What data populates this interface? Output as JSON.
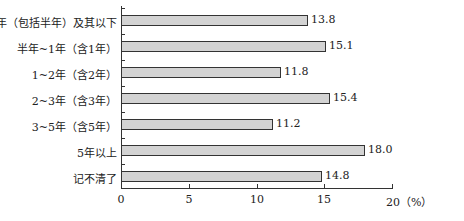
{
  "chart_data": {
    "type": "bar",
    "orientation": "horizontal",
    "title": "",
    "categories": [
      "半年（包括半年）及其以下",
      "半年~1年（含1年）",
      "1~2年（含2年）",
      "2~3年（含3年）",
      "3~5年（含5年）",
      "5年以上",
      "记不清了"
    ],
    "values": [
      13.8,
      15.1,
      11.8,
      15.4,
      11.2,
      18.0,
      14.8
    ],
    "value_labels": [
      "13.8",
      "15.1",
      "11.8",
      "15.4",
      "11.2",
      "18.0",
      "14.8"
    ],
    "xlabel": "（%）",
    "ylabel": "",
    "xlim": [
      0,
      20
    ],
    "xticks": [
      "0",
      "5",
      "10",
      "15",
      "20（%）"
    ],
    "grid": false,
    "legend": null,
    "bar_color": "#d3d3d3",
    "bar_edge_color": "#333333"
  }
}
